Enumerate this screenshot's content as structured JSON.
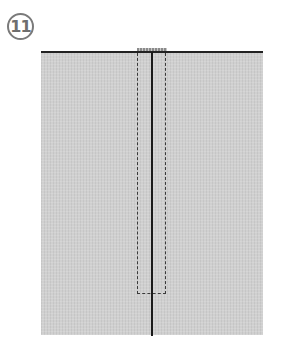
{
  "step": {
    "number": "11",
    "icon": "circled-number"
  },
  "figure": {
    "colors": {
      "fabric": "#d0d0d0",
      "edge_line": "#222222",
      "center_line": "#1a1a1a",
      "dashed_outline": "#3a3a3a",
      "badge": "#7a7a7a"
    }
  }
}
